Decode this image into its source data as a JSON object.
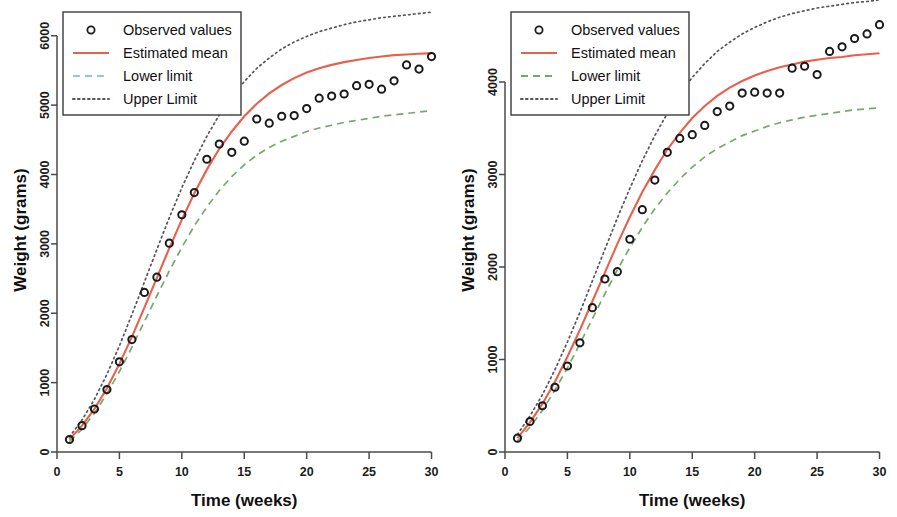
{
  "figure": {
    "background": "#ffffff",
    "panel_count": 2
  },
  "legend": {
    "items": [
      {
        "label": "Observed values",
        "style": "circle-marker",
        "color": "#1a1a1a"
      },
      {
        "label": "Estimated mean",
        "style": "solid",
        "color": "#e8604c"
      },
      {
        "label": "Lower limit",
        "style": "dashed",
        "color": "#8fc6e8"
      },
      {
        "label": "Upper Limit",
        "style": "dotted",
        "color": "#555555"
      }
    ]
  },
  "legend_right": {
    "items": [
      {
        "label": "Observed values",
        "style": "circle-marker",
        "color": "#1a1a1a"
      },
      {
        "label": "Estimated mean",
        "style": "solid",
        "color": "#e8604c"
      },
      {
        "label": "Lower limit",
        "style": "dashed",
        "color": "#77a86a"
      },
      {
        "label": "Upper Limit",
        "style": "dotted",
        "color": "#555555"
      }
    ]
  },
  "chart_data": [
    {
      "type": "scatter",
      "panel": "left",
      "title": "",
      "xlabel": "Time (weeks)",
      "ylabel": "Weight (grams)",
      "xlim": [
        0,
        31
      ],
      "ylim": [
        0,
        6400
      ],
      "xticks": [
        0,
        5,
        10,
        15,
        20,
        25,
        30
      ],
      "yticks": [
        0,
        1000,
        2000,
        3000,
        4000,
        5000,
        6000
      ],
      "grid": false,
      "legend_position": "top-left",
      "x": [
        1,
        2,
        3,
        4,
        5,
        6,
        7,
        8,
        9,
        10,
        11,
        12,
        13,
        14,
        15,
        16,
        17,
        18,
        19,
        20,
        21,
        22,
        23,
        24,
        25,
        26,
        27,
        28,
        29,
        30
      ],
      "series": [
        {
          "name": "Observed values",
          "style": "points",
          "color": "#1a1a1a",
          "values": [
            180,
            380,
            620,
            900,
            1300,
            1620,
            2300,
            2520,
            3010,
            3420,
            3740,
            4220,
            4440,
            4320,
            4480,
            4800,
            4740,
            4840,
            4850,
            4950,
            5100,
            5130,
            5160,
            5280,
            5300,
            5230,
            5350,
            5580,
            5520,
            5700
          ]
        },
        {
          "name": "Estimated mean",
          "style": "solid",
          "color": "#e8604c",
          "values": [
            180,
            380,
            620,
            920,
            1270,
            1660,
            2080,
            2510,
            2940,
            3350,
            3730,
            4070,
            4370,
            4620,
            4840,
            5020,
            5170,
            5290,
            5390,
            5470,
            5530,
            5580,
            5620,
            5650,
            5680,
            5700,
            5720,
            5730,
            5740,
            5750
          ]
        },
        {
          "name": "Lower limit",
          "style": "dashed",
          "color": "#77a86a",
          "values": [
            150,
            330,
            560,
            840,
            1160,
            1510,
            1880,
            2250,
            2610,
            2950,
            3260,
            3530,
            3770,
            3970,
            4140,
            4280,
            4390,
            4480,
            4550,
            4620,
            4670,
            4710,
            4750,
            4780,
            4810,
            4840,
            4860,
            4880,
            4900,
            4920
          ]
        },
        {
          "name": "Upper Limit",
          "style": "dotted",
          "color": "#555555",
          "values": [
            220,
            460,
            760,
            1120,
            1530,
            1980,
            2450,
            2920,
            3380,
            3810,
            4200,
            4550,
            4860,
            5120,
            5340,
            5530,
            5680,
            5810,
            5910,
            5990,
            6060,
            6110,
            6160,
            6200,
            6230,
            6260,
            6280,
            6300,
            6320,
            6340
          ]
        }
      ]
    },
    {
      "type": "scatter",
      "panel": "right",
      "title": "",
      "xlabel": "Time (weeks)",
      "ylabel": "Weight (grams)",
      "xlim": [
        0,
        31
      ],
      "ylim": [
        0,
        4800
      ],
      "xticks": [
        0,
        5,
        10,
        15,
        20,
        25,
        30
      ],
      "yticks": [
        0,
        1000,
        2000,
        3000,
        4000
      ],
      "grid": false,
      "legend_position": "top-left",
      "x": [
        1,
        2,
        3,
        4,
        5,
        6,
        7,
        8,
        9,
        10,
        11,
        12,
        13,
        14,
        15,
        16,
        17,
        18,
        19,
        20,
        21,
        22,
        23,
        24,
        25,
        26,
        27,
        28,
        29,
        30
      ],
      "series": [
        {
          "name": "Observed values",
          "style": "points",
          "color": "#1a1a1a",
          "values": [
            150,
            330,
            500,
            700,
            930,
            1180,
            1560,
            1870,
            1950,
            2300,
            2620,
            2940,
            3240,
            3390,
            3430,
            3530,
            3680,
            3740,
            3880,
            3890,
            3880,
            3880,
            4150,
            4170,
            4080,
            4330,
            4380,
            4470,
            4520,
            4620
          ]
        },
        {
          "name": "Estimated mean",
          "style": "solid",
          "color": "#e8604c",
          "values": [
            150,
            320,
            520,
            760,
            1030,
            1320,
            1630,
            1940,
            2250,
            2540,
            2810,
            3050,
            3270,
            3450,
            3610,
            3740,
            3850,
            3940,
            4010,
            4070,
            4120,
            4160,
            4190,
            4220,
            4240,
            4260,
            4270,
            4290,
            4300,
            4310
          ]
        },
        {
          "name": "Lower limit",
          "style": "dashed",
          "color": "#77a86a",
          "values": [
            120,
            270,
            450,
            670,
            910,
            1170,
            1440,
            1710,
            1970,
            2210,
            2430,
            2630,
            2800,
            2950,
            3080,
            3190,
            3280,
            3350,
            3420,
            3470,
            3520,
            3560,
            3590,
            3620,
            3640,
            3660,
            3680,
            3700,
            3710,
            3720
          ]
        },
        {
          "name": "Upper Limit",
          "style": "dotted",
          "color": "#555555",
          "values": [
            190,
            390,
            620,
            890,
            1190,
            1510,
            1850,
            2190,
            2530,
            2850,
            3150,
            3420,
            3660,
            3870,
            4050,
            4200,
            4330,
            4430,
            4520,
            4590,
            4650,
            4700,
            4740,
            4770,
            4800,
            4820,
            4840,
            4860,
            4870,
            4890
          ]
        }
      ]
    }
  ]
}
